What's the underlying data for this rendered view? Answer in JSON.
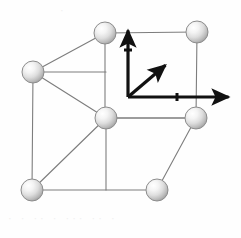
{
  "figure": {
    "width": 241,
    "height": 238,
    "background_color": "#fefefe"
  },
  "colors": {
    "edge_line": "#7d7d7d",
    "edge_line_dark": "#6a6a6a",
    "axis": "#111111",
    "atom_outline": "#8c8c8c",
    "atom_fill_light": "#fdfdfd",
    "atom_fill_mid": "#dcdcdc",
    "atom_fill_dark": "#b4b4b4",
    "noise": "#f0f0f0"
  },
  "geometry": {
    "atom_radius": 11,
    "edge_stroke_width": 1.1,
    "axis_stroke_width": 3.2,
    "tick_stroke_width": 3
  },
  "atoms": [
    {
      "name": "atom-back-top-left",
      "cx": 105,
      "cy": 33,
      "r": 11
    },
    {
      "name": "atom-back-top-right",
      "cx": 197,
      "cy": 32,
      "r": 11
    },
    {
      "name": "atom-front-top-left",
      "cx": 33,
      "cy": 72,
      "r": 11
    },
    {
      "name": "atom-center-front-top",
      "cx": 106,
      "cy": 118,
      "r": 11
    },
    {
      "name": "atom-back-bottom-right",
      "cx": 196,
      "cy": 118,
      "r": 11
    },
    {
      "name": "atom-front-bottom-left",
      "cx": 32,
      "cy": 190,
      "r": 11
    },
    {
      "name": "atom-front-bottom-right",
      "cx": 157,
      "cy": 190,
      "r": 11
    }
  ],
  "edges": [
    {
      "name": "edge-back-top",
      "x1": 105,
      "y1": 33,
      "x2": 197,
      "y2": 32
    },
    {
      "name": "edge-back-left-vertical",
      "x1": 105,
      "y1": 33,
      "x2": 105,
      "y2": 118
    },
    {
      "name": "edge-back-right-vertical",
      "x1": 197,
      "y1": 32,
      "x2": 196,
      "y2": 118
    },
    {
      "name": "edge-back-bottom",
      "x1": 105,
      "y1": 118,
      "x2": 196,
      "y2": 118
    },
    {
      "name": "edge-front-top",
      "x1": 33,
      "y1": 72,
      "x2": 106,
      "y2": 118
    },
    {
      "name": "edge-front-left-vertical",
      "x1": 33,
      "y1": 72,
      "x2": 32,
      "y2": 190
    },
    {
      "name": "edge-front-bottom-left",
      "x1": 32,
      "y1": 190,
      "x2": 157,
      "y2": 190
    },
    {
      "name": "edge-front-center-vert",
      "x1": 106,
      "y1": 118,
      "x2": 106,
      "y2": 190
    },
    {
      "name": "edge-diag-top-left",
      "x1": 33,
      "y1": 72,
      "x2": 105,
      "y2": 33
    },
    {
      "name": "edge-diag-center",
      "x1": 106,
      "y1": 118,
      "x2": 32,
      "y2": 190
    },
    {
      "name": "edge-diag-bottom-right",
      "x1": 157,
      "y1": 190,
      "x2": 196,
      "y2": 118
    },
    {
      "name": "edge-front-center-left",
      "x1": 33,
      "y1": 72,
      "x2": 106,
      "y2": 72
    },
    {
      "name": "edge-center-right",
      "x1": 106,
      "y1": 118,
      "x2": 196,
      "y2": 118
    }
  ],
  "axes": {
    "origin": {
      "x": 128,
      "y": 97
    },
    "vertical": {
      "name": "axis-vertical",
      "x1": 128,
      "y1": 97,
      "x2": 128,
      "y2": 27,
      "tick": {
        "x": 128,
        "y": 50,
        "half_len": 4
      }
    },
    "horizontal": {
      "name": "axis-horizontal",
      "x1": 128,
      "y1": 97,
      "x2": 232,
      "y2": 97,
      "tick": {
        "x": 177,
        "y": 97,
        "half_len": 4
      }
    },
    "diagonal": {
      "name": "axis-diagonal-body-vector",
      "x1": 128,
      "y1": 97,
      "x2": 168,
      "y2": 63
    }
  },
  "labels": {
    "vertical_axis": "",
    "horizontal_axis": "",
    "diagonal_axis": ""
  },
  "artifacts": {
    "bottom_noise": "·   ·     ··   ·      ···   ··   ·",
    "top_noise": "·"
  }
}
